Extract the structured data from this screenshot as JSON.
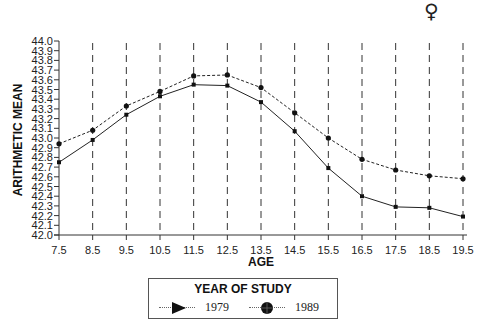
{
  "chart_data": {
    "type": "line",
    "title": "",
    "xlabel": "AGE",
    "ylabel": "ARITHMETIC MEAN",
    "x": [
      7.5,
      8.5,
      9.5,
      10.5,
      11.5,
      12.5,
      13.5,
      14.5,
      15.5,
      16.5,
      17.5,
      18.5,
      19.5
    ],
    "x_tick_labels": [
      "7.5",
      "8.5",
      "9.5",
      "10.5",
      "11.5",
      "12.5",
      "13.5",
      "14.5",
      "15.5",
      "16.5",
      "17.5",
      "18.5",
      "19.5"
    ],
    "y_tick_labels": [
      "42.0",
      "42.1",
      "42.2",
      "42.3",
      "42.4",
      "42.5",
      "42.6",
      "42.7",
      "42.8",
      "42.9",
      "43.0",
      "43.1",
      "43.2",
      "43.3",
      "43.4",
      "43.5",
      "43.6",
      "43.7",
      "43.8",
      "43.9",
      "44.0"
    ],
    "ylim": [
      42.0,
      44.0
    ],
    "xlim": [
      7.5,
      19.5
    ],
    "grid": "vertical dashed lines at each x tick",
    "legend_title": "YEAR OF STUDY",
    "legend_position": "bottom-center below plot",
    "series": [
      {
        "name": "1979",
        "style": "solid",
        "marker": "triangle",
        "values": [
          42.75,
          42.98,
          43.24,
          43.43,
          43.55,
          43.54,
          43.37,
          43.07,
          42.69,
          42.4,
          42.29,
          42.28,
          42.19
        ]
      },
      {
        "name": "1989",
        "style": "dotted",
        "marker": "circle",
        "values": [
          42.94,
          43.08,
          43.33,
          43.48,
          43.64,
          43.65,
          43.52,
          43.26,
          43.0,
          42.78,
          42.67,
          42.61,
          42.58
        ]
      }
    ],
    "annotation": "♀"
  },
  "legend": {
    "title": "YEAR OF STUDY",
    "items": [
      {
        "label": "1979",
        "marker": "triangle-right-icon"
      },
      {
        "label": "1989",
        "marker": "circle-icon"
      }
    ]
  },
  "corner_symbol": "♀"
}
